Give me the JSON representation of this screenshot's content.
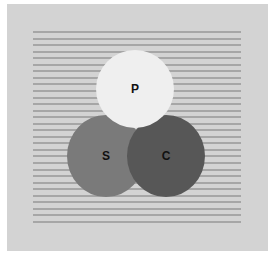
{
  "diagram": {
    "background_color": "#d3d3d3",
    "line_color": "#a6a6a6",
    "line_count": 30,
    "line_spacing_px": 6.55,
    "circles": [
      {
        "label": "S",
        "color": "#7a7a7a",
        "cx": 106,
        "cy": 156,
        "rx": 39,
        "ry": 41
      },
      {
        "label": "C",
        "color": "#575757",
        "cx": 166,
        "cy": 156,
        "rx": 39,
        "ry": 41
      },
      {
        "label": "P",
        "color": "#efefef",
        "cx": 135,
        "cy": 89,
        "rx": 39,
        "ry": 39
      }
    ]
  }
}
